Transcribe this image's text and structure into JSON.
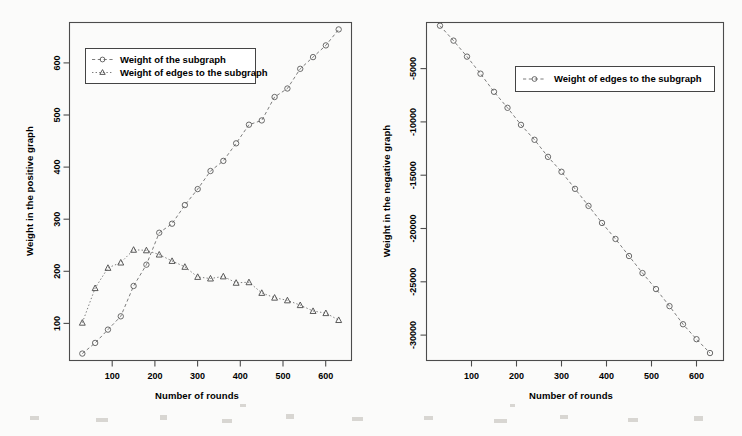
{
  "chart_data": [
    {
      "id": "positive-graph",
      "type": "line",
      "title": "",
      "xlabel": "Number of rounds",
      "ylabel": "Weight in the positive graph",
      "xlim": [
        0,
        660
      ],
      "ylim": [
        30,
        665
      ],
      "xticks": [
        100,
        200,
        300,
        400,
        500,
        600
      ],
      "yticks": [
        100,
        200,
        300,
        400,
        500,
        600
      ],
      "grid": false,
      "legend_position": "top-left",
      "series": [
        {
          "name": "Weight of the subgraph",
          "marker": "open-circle",
          "linestyle": "dashed",
          "x": [
            30,
            60,
            90,
            120,
            150,
            180,
            210,
            240,
            270,
            300,
            330,
            360,
            390,
            420,
            450,
            480,
            510,
            540,
            570,
            600,
            630
          ],
          "values": [
            43,
            63,
            88,
            113,
            170,
            210,
            270,
            287,
            322,
            352,
            386,
            405,
            438,
            473,
            481,
            525,
            541,
            578,
            600,
            622,
            652
          ]
        },
        {
          "name": "Weight of edges to the subgraph",
          "marker": "open-triangle",
          "linestyle": "dotted",
          "x": [
            30,
            60,
            90,
            120,
            150,
            180,
            210,
            240,
            270,
            300,
            330,
            360,
            390,
            420,
            450,
            480,
            510,
            540,
            570,
            600,
            630
          ],
          "values": [
            101,
            166,
            204,
            214,
            238,
            237,
            229,
            217,
            206,
            187,
            184,
            188,
            176,
            177,
            157,
            148,
            143,
            134,
            123,
            119,
            106
          ]
        }
      ]
    },
    {
      "id": "negative-graph",
      "type": "line",
      "title": "",
      "xlabel": "Number of rounds",
      "ylabel": "Weight in the negative graph",
      "xlim": [
        0,
        660
      ],
      "ylim": [
        -33500,
        -1800
      ],
      "xticks": [
        100,
        200,
        300,
        400,
        500,
        600
      ],
      "yticks": [
        -5000,
        -10000,
        -15000,
        -20000,
        -25000,
        -30000
      ],
      "grid": false,
      "legend_position": "top-center",
      "series": [
        {
          "name": "Weight of edges to the subgraph",
          "marker": "open-circle",
          "linestyle": "dashed",
          "x": [
            30,
            60,
            90,
            120,
            150,
            180,
            210,
            240,
            270,
            300,
            330,
            360,
            390,
            420,
            450,
            480,
            510,
            540,
            570,
            600,
            630
          ],
          "values": [
            -2100,
            -3500,
            -5000,
            -6600,
            -8300,
            -9800,
            -11400,
            -12800,
            -14400,
            -15800,
            -17400,
            -19000,
            -20600,
            -22100,
            -23700,
            -25300,
            -26800,
            -28400,
            -30100,
            -31500,
            -32800
          ]
        }
      ]
    }
  ],
  "left_chart": {
    "ylabel": "Weight in the positive graph",
    "xlabel": "Number of rounds",
    "yticks": [
      "100",
      "200",
      "300",
      "400",
      "500",
      "600"
    ],
    "xticks": [
      "100",
      "200",
      "300",
      "400",
      "500",
      "600"
    ],
    "legend": {
      "items": [
        {
          "label": "Weight of the subgraph",
          "marker": "open-circle"
        },
        {
          "label": "Weight of edges to the subgraph",
          "marker": "open-triangle"
        }
      ]
    }
  },
  "right_chart": {
    "ylabel": "Weight in the negative graph",
    "xlabel": "Number of rounds",
    "yticks": [
      "-5000",
      "-10000",
      "-15000",
      "-20000",
      "-25000",
      "-30000"
    ],
    "xticks": [
      "100",
      "200",
      "300",
      "400",
      "500",
      "600"
    ],
    "legend": {
      "items": [
        {
          "label": "Weight of edges to the subgraph",
          "marker": "open-circle"
        }
      ]
    }
  },
  "colors": {
    "background": "#fbfbfa",
    "axis": "#4c4c4c",
    "series": "#6e6e6e",
    "text": "#1a1a1a"
  }
}
